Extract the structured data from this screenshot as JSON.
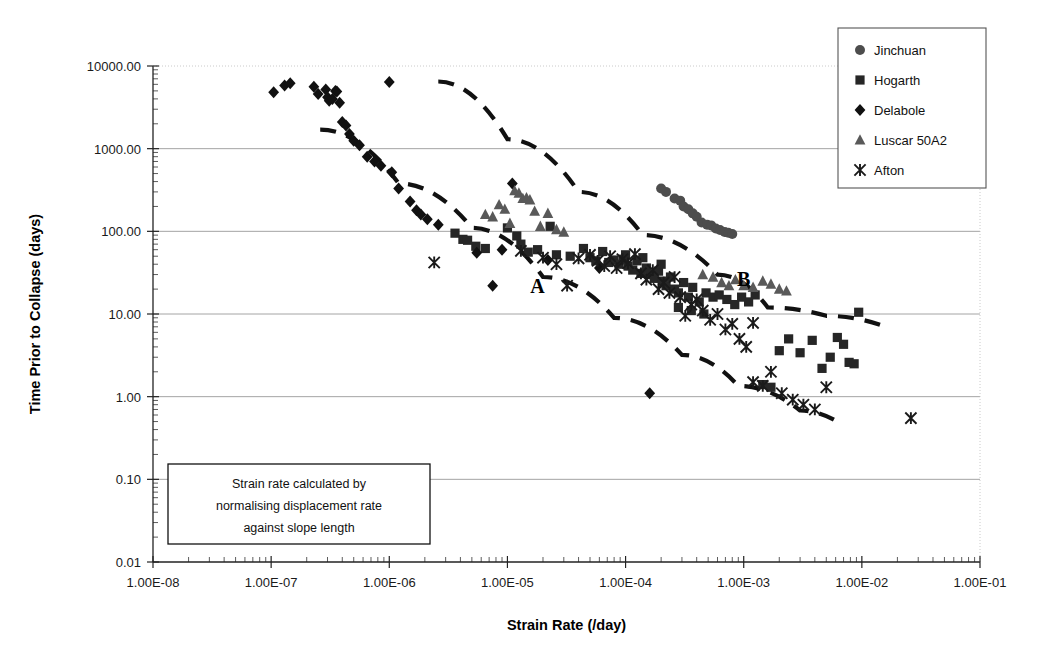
{
  "chart_data": {
    "type": "scatter",
    "title": "",
    "xlabel": "Strain Rate (/day)",
    "ylabel": "Time Prior to Collapse (days)",
    "xscale": "log",
    "yscale": "log",
    "xlim": [
      1e-08,
      0.1
    ],
    "ylim": [
      0.01,
      10000
    ],
    "grid": true,
    "legend_position": "top-right",
    "xticklabels": [
      "1.00E-08",
      "1.00E-07",
      "1.00E-06",
      "1.00E-05",
      "1.00E-04",
      "1.00E-03",
      "1.00E-02",
      "1.00E-01"
    ],
    "xtickvalues": [
      1e-08,
      1e-07,
      1e-06,
      1e-05,
      0.0001,
      0.001,
      0.01,
      0.1
    ],
    "yticklabels": [
      "10000.00",
      "1000.00",
      "100.00",
      "10.00",
      "1.00",
      "0.10",
      "0.01"
    ],
    "ytickvalues": [
      10000,
      1000,
      100,
      10,
      1,
      0.1,
      0.01
    ],
    "annotations": [
      {
        "text": "A",
        "x": 1.8e-05,
        "y": 18,
        "name": "zone-label-a"
      },
      {
        "text": "B",
        "x": 0.001,
        "y": 22,
        "name": "zone-label-b"
      }
    ],
    "textbox": {
      "lines": [
        "Strain rate calculated by",
        "normalising displacement rate",
        "against slope length"
      ]
    },
    "trend_lines": [
      {
        "name": "upper-bound-dashed",
        "style": "dashed",
        "points": [
          [
            2.6e-06,
            6500
          ],
          [
            1e-05,
            1300
          ],
          [
            4e-05,
            300
          ],
          [
            0.00014,
            90
          ],
          [
            0.0006,
            30
          ],
          [
            0.0016,
            12
          ],
          [
            0.005,
            9.5
          ],
          [
            0.016,
            7.0
          ]
        ]
      },
      {
        "name": "lower-bound-dashed",
        "style": "dashed",
        "points": [
          [
            2.6e-07,
            1700
          ],
          [
            1.2e-06,
            380
          ],
          [
            5e-06,
            110
          ],
          [
            2e-05,
            28
          ],
          [
            8e-05,
            9
          ],
          [
            0.0003,
            3.2
          ],
          [
            0.0009,
            1.35
          ],
          [
            0.003,
            0.68
          ],
          [
            0.0065,
            0.48
          ]
        ]
      }
    ],
    "series": [
      {
        "name": "Jinchuan",
        "marker": "circle",
        "color": "#4d4d4d",
        "points": [
          [
            0.00022,
            300
          ],
          [
            0.00026,
            250
          ],
          [
            0.00029,
            235
          ],
          [
            0.00031,
            200
          ],
          [
            0.00034,
            185
          ],
          [
            0.00037,
            165
          ],
          [
            0.0004,
            150
          ],
          [
            0.00044,
            128
          ],
          [
            0.00049,
            120
          ],
          [
            0.00053,
            118
          ],
          [
            0.00058,
            108
          ],
          [
            0.00063,
            104
          ],
          [
            0.00069,
            98
          ],
          [
            0.00074,
            96
          ],
          [
            0.0008,
            93
          ],
          [
            0.0002,
            330
          ]
        ]
      },
      {
        "name": "Hogarth",
        "marker": "square",
        "color": "#262626",
        "points": [
          [
            3.6e-06,
            95
          ],
          [
            4.2e-06,
            80
          ],
          [
            4.6e-06,
            78
          ],
          [
            5.4e-06,
            66
          ],
          [
            6.5e-06,
            62
          ],
          [
            1e-05,
            110
          ],
          [
            1.2e-05,
            88
          ],
          [
            1.3e-05,
            70
          ],
          [
            1.5e-05,
            56
          ],
          [
            1.8e-05,
            60
          ],
          [
            2.3e-05,
            115
          ],
          [
            2.6e-05,
            52
          ],
          [
            3.4e-05,
            50
          ],
          [
            4.4e-05,
            62
          ],
          [
            5e-05,
            48
          ],
          [
            5.6e-05,
            44
          ],
          [
            6.4e-05,
            57
          ],
          [
            7.2e-05,
            42
          ],
          [
            8e-05,
            45
          ],
          [
            8.8e-05,
            40
          ],
          [
            9.6e-05,
            46
          ],
          [
            0.000105,
            38
          ],
          [
            0.000115,
            34
          ],
          [
            0.000125,
            44
          ],
          [
            0.000135,
            31
          ],
          [
            0.00015,
            36
          ],
          [
            0.00016,
            30
          ],
          [
            0.000175,
            27
          ],
          [
            0.00019,
            33
          ],
          [
            0.000205,
            25
          ],
          [
            0.00022,
            22
          ],
          [
            0.00024,
            28
          ],
          [
            0.00026,
            20
          ],
          [
            0.00028,
            18
          ],
          [
            0.00031,
            24
          ],
          [
            0.00034,
            16
          ],
          [
            0.00037,
            21
          ],
          [
            0.00042,
            14
          ],
          [
            0.00048,
            18
          ],
          [
            0.00055,
            16
          ],
          [
            0.00062,
            17
          ],
          [
            0.00072,
            15
          ],
          [
            0.00084,
            13
          ],
          [
            0.00096,
            16
          ],
          [
            0.0011,
            14
          ],
          [
            0.00125,
            17
          ],
          [
            0.00145,
            1.4
          ],
          [
            0.0017,
            1.3
          ],
          [
            0.002,
            3.6
          ],
          [
            0.0024,
            5.0
          ],
          [
            0.003,
            3.4
          ],
          [
            0.0038,
            4.8
          ],
          [
            0.0046,
            2.2
          ],
          [
            0.0054,
            3.0
          ],
          [
            0.0062,
            5.2
          ],
          [
            0.007,
            4.3
          ],
          [
            0.0078,
            2.6
          ],
          [
            0.0086,
            2.5
          ],
          [
            0.0094,
            10.5
          ],
          [
            0.0001,
            52
          ],
          [
            0.00014,
            48
          ],
          [
            0.0002,
            40
          ],
          [
            0.00028,
            12
          ],
          [
            0.00036,
            11
          ],
          [
            0.00046,
            10
          ]
        ]
      },
      {
        "name": "Delabole",
        "marker": "diamond",
        "color": "#111111",
        "points": [
          [
            1.05e-07,
            4800
          ],
          [
            1.3e-07,
            5800
          ],
          [
            1.45e-07,
            6200
          ],
          [
            2.3e-07,
            5600
          ],
          [
            2.5e-07,
            4600
          ],
          [
            2.9e-07,
            5200
          ],
          [
            3e-07,
            4200
          ],
          [
            3.1e-07,
            3800
          ],
          [
            3.3e-07,
            4000
          ],
          [
            3.5e-07,
            5000
          ],
          [
            3.6e-07,
            4900
          ],
          [
            3.8e-07,
            3600
          ],
          [
            4e-07,
            2100
          ],
          [
            4.3e-07,
            1900
          ],
          [
            4.6e-07,
            1500
          ],
          [
            5e-07,
            1250
          ],
          [
            5.6e-07,
            1100
          ],
          [
            6.5e-07,
            800
          ],
          [
            7.5e-07,
            700
          ],
          [
            8.5e-07,
            620
          ],
          [
            1e-06,
            6400
          ],
          [
            1.05e-06,
            520
          ],
          [
            1.2e-06,
            330
          ],
          [
            1.5e-06,
            230
          ],
          [
            1.7e-06,
            180
          ],
          [
            1.85e-06,
            160
          ],
          [
            2.1e-06,
            140
          ],
          [
            2.6e-06,
            120
          ],
          [
            5.5e-06,
            55
          ],
          [
            7.5e-06,
            22
          ],
          [
            1.1e-05,
            380
          ],
          [
            2.2e-05,
            45
          ],
          [
            6e-05,
            36
          ],
          [
            0.00016,
            1.1
          ],
          [
            9e-06,
            60
          ]
        ]
      },
      {
        "name": "Luscar 50A2",
        "marker": "triangle",
        "color": "#595959",
        "points": [
          [
            6.5e-06,
            160
          ],
          [
            7.5e-06,
            150
          ],
          [
            8.5e-06,
            210
          ],
          [
            9.5e-06,
            185
          ],
          [
            1.05e-05,
            125
          ],
          [
            1.15e-05,
            310
          ],
          [
            1.25e-05,
            290
          ],
          [
            1.35e-05,
            250
          ],
          [
            1.45e-05,
            255
          ],
          [
            1.55e-05,
            240
          ],
          [
            1.7e-05,
            175
          ],
          [
            1.9e-05,
            115
          ],
          [
            2.2e-05,
            165
          ],
          [
            2.6e-05,
            105
          ],
          [
            3e-05,
            98
          ],
          [
            0.00045,
            30
          ],
          [
            0.00055,
            28
          ],
          [
            0.00065,
            24
          ],
          [
            0.00075,
            22
          ],
          [
            0.00085,
            26
          ],
          [
            0.001,
            22
          ],
          [
            0.0012,
            21
          ],
          [
            0.00145,
            25
          ],
          [
            0.0017,
            23
          ],
          [
            0.002,
            20
          ],
          [
            0.0023,
            19
          ]
        ]
      },
      {
        "name": "Afton",
        "marker": "cross",
        "color": "#1a1a1a",
        "points": [
          [
            2.4e-06,
            42
          ],
          [
            1.3e-05,
            58
          ],
          [
            2e-05,
            48
          ],
          [
            2.6e-05,
            40
          ],
          [
            3.2e-05,
            22
          ],
          [
            4e-05,
            47
          ],
          [
            5e-05,
            52
          ],
          [
            5.8e-05,
            44
          ],
          [
            6.6e-05,
            38
          ],
          [
            7.4e-05,
            50
          ],
          [
            8.4e-05,
            36
          ],
          [
            9.4e-05,
            46
          ],
          [
            0.000105,
            41
          ],
          [
            0.00012,
            53
          ],
          [
            0.000135,
            31
          ],
          [
            0.00015,
            26
          ],
          [
            0.00017,
            34
          ],
          [
            0.00019,
            20
          ],
          [
            0.00021,
            24
          ],
          [
            0.000235,
            18
          ],
          [
            0.00026,
            28
          ],
          [
            0.00029,
            16
          ],
          [
            0.00032,
            9.5
          ],
          [
            0.00036,
            13
          ],
          [
            0.0004,
            15
          ],
          [
            0.00045,
            11
          ],
          [
            0.00052,
            8.5
          ],
          [
            0.0006,
            10
          ],
          [
            0.0007,
            6.5
          ],
          [
            0.0008,
            7.6
          ],
          [
            0.00092,
            5.0
          ],
          [
            0.00105,
            4.0
          ],
          [
            0.0012,
            1.5
          ],
          [
            0.00145,
            1.35
          ],
          [
            0.0017,
            2.0
          ],
          [
            0.0021,
            1.1
          ],
          [
            0.0026,
            0.92
          ],
          [
            0.0032,
            0.8
          ],
          [
            0.004,
            0.7
          ],
          [
            0.005,
            1.3
          ],
          [
            0.026,
            0.55
          ],
          [
            0.0012,
            7.8
          ]
        ]
      }
    ]
  }
}
